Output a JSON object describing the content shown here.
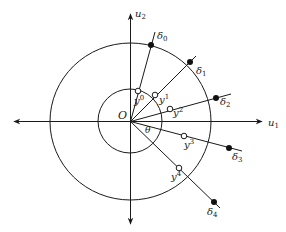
{
  "figure": {
    "axes": {
      "horizontal_label": "u",
      "horizontal_sub": "1",
      "vertical_label": "u",
      "vertical_sub": "2",
      "origin_label": "O",
      "angle_label": "θ"
    },
    "circles": [
      {
        "name": "inner-circle",
        "cx": 130,
        "cy": 121,
        "r": 32
      },
      {
        "name": "outer-circle",
        "cx": 130.5,
        "cy": 121.5,
        "rx": 80.5,
        "ry": 78.5
      }
    ],
    "rays": [
      {
        "index": "0",
        "end": [
          155,
          32
        ],
        "open_point": [
          138,
          91
        ],
        "filled_point": [
          151,
          45
        ],
        "y_label": "y",
        "y_sup": "0",
        "y_label_pos": [
          134,
          104
        ],
        "delta_label": "δ",
        "delta_sub": "0",
        "delta_label_pos": [
          157,
          39
        ]
      },
      {
        "index": "1",
        "end": [
          196,
          56
        ],
        "open_point": [
          155,
          95
        ],
        "filled_point": [
          190,
          62
        ],
        "y_label": "y",
        "y_sup": "1",
        "y_label_pos": [
          159,
          103
        ],
        "delta_label": "δ",
        "delta_sub": "1",
        "delta_label_pos": [
          196,
          74
        ]
      },
      {
        "index": "2",
        "end": [
          231,
          94
        ],
        "open_point": [
          170,
          109
        ],
        "filled_point": [
          216,
          98
        ],
        "y_label": "y",
        "y_sup": "2",
        "y_label_pos": [
          173,
          116
        ],
        "delta_label": "δ",
        "delta_sub": "2",
        "delta_label_pos": [
          220,
          105
        ]
      },
      {
        "index": "3",
        "end": [
          242,
          151
        ],
        "open_point": [
          184,
          136
        ],
        "filled_point": [
          229,
          148
        ],
        "y_label": "y",
        "y_sup": "3",
        "y_label_pos": [
          184,
          148
        ],
        "delta_label": "δ",
        "delta_sub": "3",
        "delta_label_pos": [
          232,
          160
        ]
      },
      {
        "index": "4",
        "end": [
          220,
          208
        ],
        "open_point": [
          179,
          168
        ],
        "filled_point": [
          214,
          202
        ],
        "y_label": "y",
        "y_sup": "4",
        "y_label_pos": [
          171,
          180
        ],
        "delta_label": "δ",
        "delta_sub": "4",
        "delta_label_pos": [
          207,
          215
        ]
      }
    ]
  }
}
